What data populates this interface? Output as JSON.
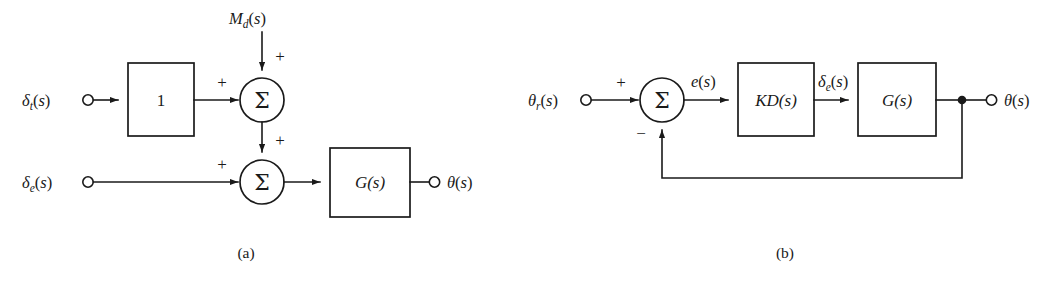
{
  "figure": {
    "background_color": "#ffffff",
    "line_color": "#1a1a1a",
    "type": "control-system-block-diagram"
  },
  "diagram_a": {
    "caption": "(a)",
    "inputs": [
      {
        "name": "throttle-input",
        "label_base": "δ",
        "label_sub": "t",
        "label_tail": "(s)",
        "full": "δt(s)"
      },
      {
        "name": "elevator-input",
        "label_base": "δ",
        "label_sub": "e",
        "label_tail": "(s)",
        "full": "δe(s)"
      },
      {
        "name": "disturbance-input",
        "label_base": "M",
        "label_sub": "d",
        "label_tail": "(s)",
        "full": "Md(s)"
      }
    ],
    "blocks": [
      {
        "name": "gain-block",
        "label": "1"
      },
      {
        "name": "plant-block",
        "label": "G(s)"
      }
    ],
    "summers": [
      {
        "name": "summing-junction-top",
        "glyph": "Σ",
        "signs": [
          "+",
          "+"
        ]
      },
      {
        "name": "summing-junction-bottom",
        "glyph": "Σ",
        "signs": [
          "+",
          "+"
        ]
      }
    ],
    "output": {
      "name": "theta-output",
      "label_base": "θ",
      "label_tail": "(s)",
      "full": "θ(s)"
    }
  },
  "diagram_b": {
    "caption": "(b)",
    "input": {
      "name": "reference-input",
      "label_base": "θ",
      "label_sub": "r",
      "label_tail": "(s)",
      "full": "θr(s)"
    },
    "summer": {
      "name": "summing-junction",
      "glyph": "Σ",
      "sign_positive": "+",
      "sign_negative": "−"
    },
    "signals": [
      {
        "name": "error-signal",
        "label_base": "e",
        "label_tail": "(s)",
        "full": "e(s)"
      },
      {
        "name": "elevator-signal",
        "label_base": "δ",
        "label_sub": "e",
        "label_tail": "(s)",
        "full": "δe(s)"
      }
    ],
    "blocks": [
      {
        "name": "controller-block",
        "label": "KD(s)"
      },
      {
        "name": "plant-block",
        "label": "G(s)"
      }
    ],
    "output": {
      "name": "theta-output",
      "label_base": "θ",
      "label_tail": "(s)",
      "full": "θ(s)"
    },
    "feedback": {
      "name": "feedback-path",
      "takeoff": "unity-feedback-node"
    }
  }
}
